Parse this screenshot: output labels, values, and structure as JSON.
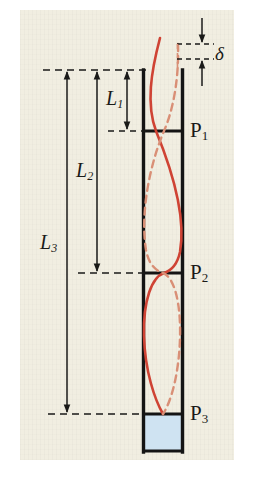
{
  "figure": {
    "kind": "engineering-diagram",
    "background_color": "#f1eee1",
    "page_color": "#ffffff"
  },
  "colors": {
    "paper": "#f1eee1",
    "ink": "#1a1a18",
    "column_outline": "#141414",
    "mode_solid": "#cf4334",
    "mode_dashed": "#d98f76",
    "base_block": "#cfe3f2",
    "base_block_edge": "#141414"
  },
  "labels": {
    "delta": "δ",
    "length_1": "L",
    "length_1_sub": "1",
    "length_2": "L",
    "length_2_sub": "2",
    "length_3": "L",
    "length_3_sub": "3",
    "point_1": "P",
    "point_1_sub": "1",
    "point_2": "P",
    "point_2_sub": "2",
    "point_3": "P",
    "point_3_sub": "3"
  },
  "geometry": {
    "column_left_x": 143,
    "column_right_x": 183,
    "top_y": 70,
    "p1_y": 131,
    "p2_y": 273,
    "p3_y": 414,
    "base_bottom_y": 452,
    "delta_top_y": 44,
    "delta_bottom_y": 70
  },
  "dimensions": [
    {
      "name": "L1",
      "from_y": 70,
      "to_y": 131,
      "x": 127,
      "label": "L₁"
    },
    {
      "name": "L2",
      "from_y": 70,
      "to_y": 273,
      "x": 97,
      "label": "L₂"
    },
    {
      "name": "L3",
      "from_y": 70,
      "to_y": 414,
      "x": 67,
      "label": "L₃"
    }
  ],
  "points": [
    {
      "name": "P1",
      "y": 131,
      "label": "P₁"
    },
    {
      "name": "P2",
      "y": 273,
      "label": "P₂"
    },
    {
      "name": "P3",
      "y": 414,
      "label": "P₃"
    }
  ]
}
